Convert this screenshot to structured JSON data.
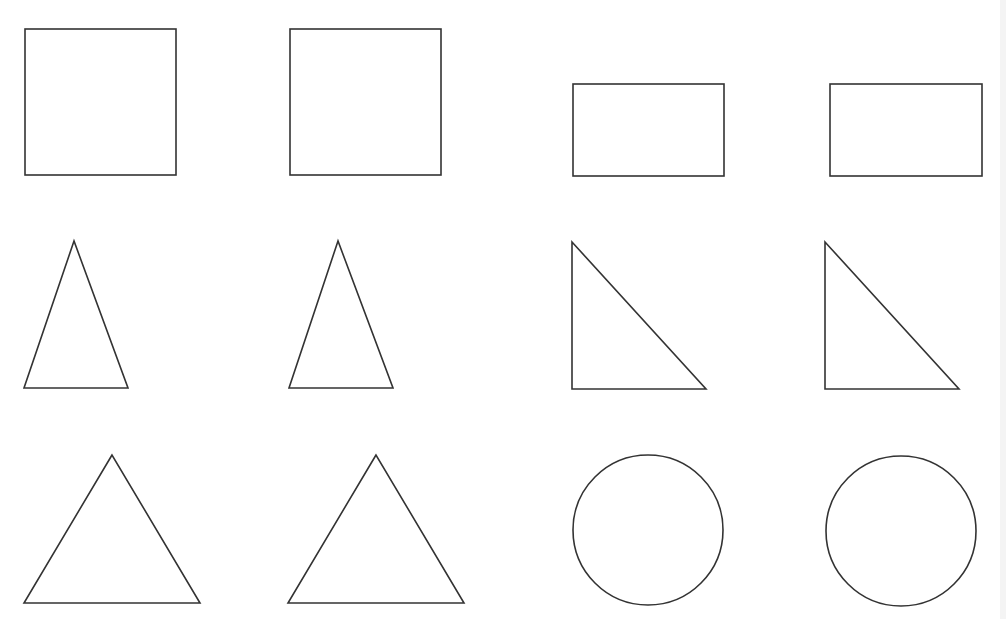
{
  "diagram": {
    "stroke_color": "#333333",
    "fill_color": "#ffffff",
    "background": "#ffffff",
    "shapes": [
      {
        "name": "square-1",
        "type": "rect",
        "x": 25,
        "y": 29,
        "w": 151,
        "h": 146
      },
      {
        "name": "square-2",
        "type": "rect",
        "x": 290,
        "y": 29,
        "w": 151,
        "h": 146
      },
      {
        "name": "rectangle-1",
        "type": "rect",
        "x": 573,
        "y": 84,
        "w": 151,
        "h": 92
      },
      {
        "name": "rectangle-2",
        "type": "rect",
        "x": 830,
        "y": 84,
        "w": 152,
        "h": 92
      },
      {
        "name": "narrow-triangle-1",
        "type": "polygon",
        "points": "74,241 24,388 128,388"
      },
      {
        "name": "narrow-triangle-2",
        "type": "polygon",
        "points": "338,241 289,388 393,388"
      },
      {
        "name": "right-triangle-1",
        "type": "polygon",
        "points": "572,242 572,389 706,389"
      },
      {
        "name": "right-triangle-2",
        "type": "polygon",
        "points": "825,242 825,389 959,389"
      },
      {
        "name": "equilateral-triangle-1",
        "type": "polygon",
        "points": "112,455 24,603 200,603"
      },
      {
        "name": "equilateral-triangle-2",
        "type": "polygon",
        "points": "376,455 288,603 464,603"
      },
      {
        "name": "circle-1",
        "type": "circle",
        "cx": 648,
        "cy": 530,
        "r": 75
      },
      {
        "name": "circle-2",
        "type": "circle",
        "cx": 901,
        "cy": 531,
        "r": 75
      }
    ]
  }
}
